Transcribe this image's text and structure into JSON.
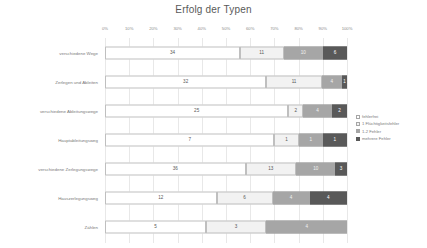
{
  "chart_data": {
    "type": "bar",
    "subtype": "stacked-horizontal-100-percent",
    "title": "Erfolg der Typen",
    "xlabel": "",
    "ylabel": "",
    "xlim": [
      0,
      100
    ],
    "xunit": "%",
    "grid": true,
    "legend_position": "right",
    "xticks": [
      "0%",
      "10%",
      "20%",
      "30%",
      "40%",
      "50%",
      "60%",
      "70%",
      "80%",
      "90%",
      "100%"
    ],
    "xtick_values": [
      0,
      10,
      20,
      30,
      40,
      50,
      60,
      70,
      80,
      90,
      100
    ],
    "categories": [
      "verschiedene Wege",
      "Zerlegen und Ableiten",
      "verschiedene Ableitungswege",
      "Hauptableitungsweg",
      "verschiedene Zerlegungswege",
      "Hauszerlegungsweg",
      "Zählen"
    ],
    "series": [
      {
        "name": "fehlerfrei",
        "color": "#ffffff",
        "values": [
          34,
          32,
          25,
          7,
          36,
          12,
          5
        ]
      },
      {
        "name": "1 Flüchtigkeitsfehler",
        "color": "#f2f2f2",
        "values": [
          11,
          11,
          2,
          1,
          13,
          6,
          3
        ]
      },
      {
        "name": "1-2 Fehler",
        "color": "#a6a6a6",
        "values": [
          10,
          4,
          4,
          1,
          10,
          4,
          4
        ]
      },
      {
        "name": "mehrere Fehler",
        "color": "#595959",
        "values": [
          6,
          1,
          2,
          1,
          3,
          4,
          0
        ]
      }
    ]
  },
  "colors": {
    "text": "#595959",
    "muted": "#7a7a7a",
    "gridline": "#e8e8e8",
    "series_0": "#ffffff",
    "series_1": "#f2f2f2",
    "series_2": "#a6a6a6",
    "series_3": "#595959"
  }
}
